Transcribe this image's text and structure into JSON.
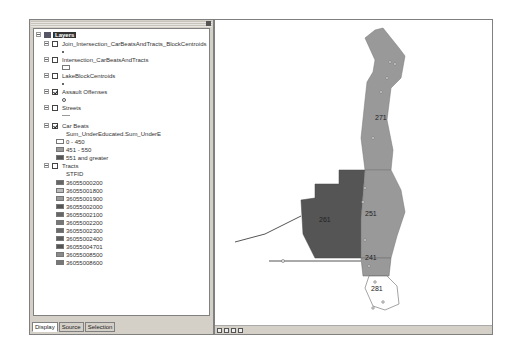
{
  "toc": {
    "root_label": "Layers",
    "layers": [
      {
        "label": "Join_Intersection_CarBeatsAndTracts_BlockCentroids",
        "checked": false,
        "symbol": "dot"
      },
      {
        "label": "Intersection_CarBeatsAndTracts",
        "checked": false,
        "symbol": "box"
      },
      {
        "label": "LakeBlockCentroids",
        "checked": false,
        "symbol": "dot"
      },
      {
        "label": "Assault Offenses",
        "checked": true,
        "symbol": "circle"
      },
      {
        "label": "Streets",
        "checked": false,
        "symbol": "line"
      },
      {
        "label": "Car Beats",
        "checked": true,
        "field": "Sum_UnderEducated.Sum_UnderE",
        "classes": [
          {
            "label": "0 - 450",
            "color": "#ffffff"
          },
          {
            "label": "451 - 550",
            "color": "#999999"
          },
          {
            "label": "551 and greater",
            "color": "#555555"
          }
        ]
      },
      {
        "label": "Tracts",
        "checked": false,
        "field": "STFID",
        "classes": [
          {
            "label": "36055000200",
            "color": "#666666"
          },
          {
            "label": "36055001800",
            "color": "#bbbbbb"
          },
          {
            "label": "36055001900",
            "color": "#999999"
          },
          {
            "label": "36055002000",
            "color": "#555555"
          },
          {
            "label": "36055002100",
            "color": "#666666"
          },
          {
            "label": "36055002200",
            "color": "#777777"
          },
          {
            "label": "36055002300",
            "color": "#6a6a6a"
          },
          {
            "label": "36055002400",
            "color": "#5e5e5e"
          },
          {
            "label": "36055004701",
            "color": "#555555"
          },
          {
            "label": "36055008500",
            "color": "#8a8a8a"
          },
          {
            "label": "36055008600",
            "color": "#777777"
          }
        ]
      }
    ],
    "tabs": [
      "Display",
      "Source",
      "Selection"
    ]
  },
  "map": {
    "labels": [
      {
        "text": "271"
      },
      {
        "text": "261"
      },
      {
        "text": "251"
      },
      {
        "text": "241"
      },
      {
        "text": "281"
      }
    ]
  }
}
